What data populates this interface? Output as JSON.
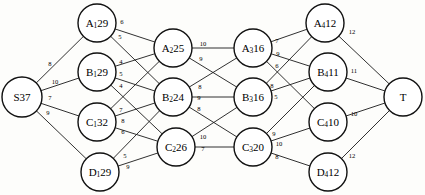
{
  "diagram": {
    "type": "directed-network-flow",
    "colors": {
      "background": "#fdfdfb",
      "node_fill": "#ffffff",
      "node_stroke": "#111111",
      "edge_stroke": "#1a1a1a",
      "text": "#000000"
    }
  },
  "nodes": [
    {
      "id": "S",
      "base": "S",
      "sub": "",
      "value": "37",
      "label": "S37",
      "x": 22,
      "y": 97,
      "r": 20
    },
    {
      "id": "A1",
      "base": "A",
      "sub": "1",
      "value": "29",
      "label": "A₁29",
      "x": 97,
      "y": 23,
      "r": 19
    },
    {
      "id": "B1",
      "base": "B",
      "sub": "1",
      "value": "29",
      "label": "B₁29",
      "x": 97,
      "y": 72,
      "r": 19
    },
    {
      "id": "C1",
      "base": "C",
      "sub": "1",
      "value": "32",
      "label": "C₁32",
      "x": 97,
      "y": 122,
      "r": 19
    },
    {
      "id": "D1",
      "base": "D",
      "sub": "1",
      "value": "29",
      "label": "D₁29",
      "x": 100,
      "y": 172,
      "r": 19
    },
    {
      "id": "A2",
      "base": "A",
      "sub": "2",
      "value": "25",
      "label": "A₂25",
      "x": 173,
      "y": 48,
      "r": 19
    },
    {
      "id": "B2",
      "base": "B",
      "sub": "2",
      "value": "24",
      "label": "B₂24",
      "x": 173,
      "y": 97,
      "r": 19
    },
    {
      "id": "C2",
      "base": "C",
      "sub": "2",
      "value": "26",
      "label": "C₂26",
      "x": 176,
      "y": 147,
      "r": 19
    },
    {
      "id": "A3",
      "base": "A",
      "sub": "3",
      "value": "16",
      "label": "A₃16",
      "x": 253,
      "y": 48,
      "r": 19
    },
    {
      "id": "B3",
      "base": "B",
      "sub": "3",
      "value": "16",
      "label": "B₃16",
      "x": 253,
      "y": 97,
      "r": 19
    },
    {
      "id": "C3",
      "base": "C",
      "sub": "3",
      "value": "20",
      "label": "C₃20",
      "x": 253,
      "y": 147,
      "r": 19
    },
    {
      "id": "A4",
      "base": "A",
      "sub": "4",
      "value": "12",
      "label": "A₄12",
      "x": 325,
      "y": 23,
      "r": 19
    },
    {
      "id": "B4",
      "base": "B",
      "sub": "4",
      "value": "11",
      "label": "B₄11",
      "x": 328,
      "y": 72,
      "r": 19
    },
    {
      "id": "C4",
      "base": "C",
      "sub": "4",
      "value": "10",
      "label": "C₄10",
      "x": 328,
      "y": 122,
      "r": 19
    },
    {
      "id": "D4",
      "base": "D",
      "sub": "4",
      "value": "12",
      "label": "D₄12",
      "x": 328,
      "y": 172,
      "r": 19
    },
    {
      "id": "T",
      "base": "T",
      "sub": "",
      "value": "",
      "label": "T",
      "x": 403,
      "y": 97,
      "r": 19
    }
  ],
  "edges": [
    {
      "from": "S",
      "to": "A1",
      "weight": "8",
      "lx": 50,
      "ly": 63
    },
    {
      "from": "S",
      "to": "B1",
      "weight": "10",
      "lx": 55,
      "ly": 81
    },
    {
      "from": "S",
      "to": "C1",
      "weight": "7",
      "lx": 50,
      "ly": 97
    },
    {
      "from": "S",
      "to": "D1",
      "weight": "9",
      "lx": 48,
      "ly": 112
    },
    {
      "from": "A1",
      "to": "A2",
      "weight": "6",
      "lx": 122,
      "ly": 21
    },
    {
      "from": "A1",
      "to": "B2",
      "weight": "5",
      "lx": 120,
      "ly": 36
    },
    {
      "from": "B1",
      "to": "A2",
      "weight": "4",
      "lx": 121,
      "ly": 61
    },
    {
      "from": "B1",
      "to": "B2",
      "weight": "5",
      "lx": 121,
      "ly": 73
    },
    {
      "from": "B1",
      "to": "C2",
      "weight": "4",
      "lx": 121,
      "ly": 85
    },
    {
      "from": "C1",
      "to": "A2",
      "weight": "7",
      "lx": 121,
      "ly": 109
    },
    {
      "from": "C1",
      "to": "B2",
      "weight": "8",
      "lx": 123,
      "ly": 120
    },
    {
      "from": "C1",
      "to": "C2",
      "weight": "6",
      "lx": 123,
      "ly": 131
    },
    {
      "from": "D1",
      "to": "B2",
      "weight": "5",
      "lx": 125,
      "ly": 155
    },
    {
      "from": "D1",
      "to": "C2",
      "weight": "9",
      "lx": 128,
      "ly": 166
    },
    {
      "from": "A2",
      "to": "A3",
      "weight": "10",
      "lx": 203,
      "ly": 43
    },
    {
      "from": "A2",
      "to": "B3",
      "weight": "9",
      "lx": 201,
      "ly": 58
    },
    {
      "from": "B2",
      "to": "A3",
      "weight": "8",
      "lx": 200,
      "ly": 86
    },
    {
      "from": "B2",
      "to": "B3",
      "weight": "9",
      "lx": 199,
      "ly": 97
    },
    {
      "from": "B2",
      "to": "C3",
      "weight": "8",
      "lx": 199,
      "ly": 108
    },
    {
      "from": "C2",
      "to": "B3",
      "weight": "10",
      "lx": 203,
      "ly": 136
    },
    {
      "from": "C2",
      "to": "C3",
      "weight": "7",
      "lx": 203,
      "ly": 148
    },
    {
      "from": "A3",
      "to": "A4",
      "weight": "7",
      "lx": 277,
      "ly": 40
    },
    {
      "from": "A3",
      "to": "B4",
      "weight": "9",
      "lx": 278,
      "ly": 53
    },
    {
      "from": "A3",
      "to": "C4",
      "weight": "6",
      "lx": 277,
      "ly": 65
    },
    {
      "from": "B3",
      "to": "A4",
      "weight": "8",
      "lx": 272,
      "ly": 85
    },
    {
      "from": "B3",
      "to": "B4",
      "weight": "5",
      "lx": 276,
      "ly": 96
    },
    {
      "from": "C3",
      "to": "B4",
      "weight": "9",
      "lx": 274,
      "ly": 133
    },
    {
      "from": "C3",
      "to": "C4",
      "weight": "10",
      "lx": 279,
      "ly": 143
    },
    {
      "from": "C3",
      "to": "D4",
      "weight": "8",
      "lx": 277,
      "ly": 156
    },
    {
      "from": "A4",
      "to": "T",
      "weight": "12",
      "lx": 352,
      "ly": 31
    },
    {
      "from": "B4",
      "to": "T",
      "weight": "11",
      "lx": 354,
      "ly": 70
    },
    {
      "from": "C4",
      "to": "T",
      "weight": "10",
      "lx": 354,
      "ly": 113
    },
    {
      "from": "D4",
      "to": "T",
      "weight": "12",
      "lx": 352,
      "ly": 155
    }
  ]
}
